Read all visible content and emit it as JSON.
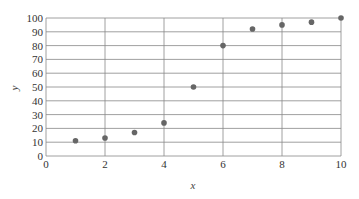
{
  "chart_data": {
    "type": "scatter",
    "title": "",
    "xlabel": "x",
    "ylabel": "y",
    "xlim": [
      0,
      10
    ],
    "ylim": [
      0,
      100
    ],
    "x_ticks": [
      0,
      2,
      4,
      6,
      8,
      10
    ],
    "y_ticks": [
      0,
      10,
      20,
      30,
      40,
      50,
      60,
      70,
      80,
      90,
      100
    ],
    "grid": true,
    "legend": null,
    "series": [
      {
        "name": "data",
        "color": "#666666",
        "x": [
          1,
          2,
          3,
          4,
          5,
          6,
          7,
          8,
          9,
          10
        ],
        "y": [
          11,
          13,
          17,
          24,
          50,
          80,
          92,
          95,
          97,
          100
        ]
      }
    ]
  },
  "colors": {
    "grid": "#888888",
    "axis": "#777777",
    "point": "#666666"
  }
}
